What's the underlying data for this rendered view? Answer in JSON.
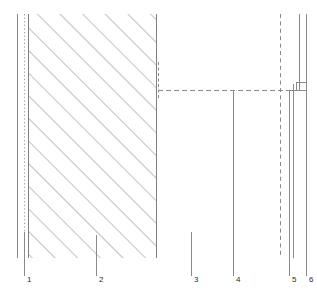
{
  "figure": {
    "type": "technical-cross-section-drawing",
    "width": 317,
    "height": 303,
    "background_color": "#ffffff",
    "line_color": "#808080",
    "hatch_color": "#8c8c8c",
    "label_color": "#2b2b2b"
  },
  "callouts": [
    {
      "id": "1",
      "label": "1",
      "label_x": 27,
      "label_y": 282,
      "leader_x": 24,
      "leader_top": 232,
      "leader_bottom": 276
    },
    {
      "id": "2",
      "label": "2",
      "label_x": 99,
      "label_y": 282,
      "leader_x": 96,
      "leader_top": 235,
      "leader_bottom": 276
    },
    {
      "id": "3",
      "label": "3",
      "label_x": 194,
      "label_y": 282,
      "leader_x": 191,
      "leader_top": 232,
      "leader_bottom": 276
    },
    {
      "id": "4",
      "label": "4",
      "label_x": 236,
      "label_y": 282,
      "leader_x": 233,
      "leader_top": 90,
      "leader_bottom": 276
    },
    {
      "id": "5",
      "label": "5",
      "label_x": 292,
      "label_y": 282,
      "leader_x": 289,
      "leader_top": 236,
      "leader_bottom": 276
    },
    {
      "id": "6",
      "label": "6",
      "label_x": 309,
      "label_y": 282,
      "leader_x": 306,
      "leader_top": 236,
      "leader_bottom": 276
    }
  ],
  "geometry": {
    "hatched_block": {
      "x_left": 28,
      "x_right": 156,
      "y_top": 14,
      "y_bottom": 258,
      "hatch_angle_deg": -45,
      "hatch_spacing": 16
    },
    "vertical_lines": [
      {
        "name": "outer-left-edge",
        "x": 17,
        "y_top": 14,
        "y_bottom": 258,
        "style": "solid"
      },
      {
        "name": "inner-left-dotted",
        "x": 24,
        "y_top": 14,
        "y_bottom": 258,
        "style": "dotted"
      },
      {
        "name": "block-left-edge",
        "x": 28,
        "y_top": 14,
        "y_bottom": 258,
        "style": "solid"
      },
      {
        "name": "block-right-edge",
        "x": 156,
        "y_top": 14,
        "y_bottom": 258,
        "style": "solid"
      },
      {
        "name": "interface-tick",
        "x": 158,
        "y_top": 62,
        "y_bottom": 98,
        "style": "dashed"
      },
      {
        "name": "right-dashed-boundary",
        "x": 280,
        "y_top": 14,
        "y_bottom": 258,
        "style": "dashed"
      },
      {
        "name": "layer-line-5-upper",
        "x": 289,
        "y_top": 90,
        "y_bottom": 258,
        "style": "solid"
      },
      {
        "name": "layer-line-6-outer",
        "x": 299,
        "y_top": 14,
        "y_bottom": 90,
        "style": "solid"
      },
      {
        "name": "layer-line-6-edge",
        "x": 306,
        "y_top": 14,
        "y_bottom": 258,
        "style": "solid"
      }
    ],
    "horizontal_lines": [
      {
        "name": "mid-interface-dashed",
        "y": 90,
        "x_left": 158,
        "x_right": 306,
        "style": "dashed"
      },
      {
        "name": "junction-step-top",
        "y": 82,
        "x_left": 296,
        "x_right": 306,
        "style": "solid"
      },
      {
        "name": "junction-step-bottom",
        "y": 90,
        "x_left": 286,
        "x_right": 306,
        "style": "solid"
      }
    ]
  }
}
